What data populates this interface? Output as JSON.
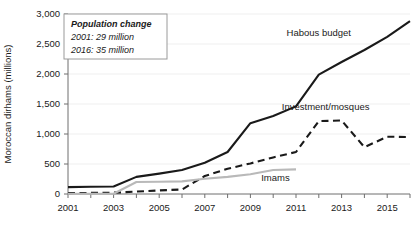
{
  "chart_data": {
    "type": "line",
    "title": "",
    "xlabel": "",
    "ylabel": "Moroccan dirhams (millions)",
    "xlim": [
      2001,
      2016
    ],
    "ylim": [
      0,
      3000
    ],
    "grid": true,
    "legend_position": "inline-labels",
    "x": [
      2001,
      2002,
      2003,
      2004,
      2005,
      2006,
      2007,
      2008,
      2009,
      2010,
      2011,
      2012,
      2013,
      2014,
      2015,
      2016
    ],
    "xticks": [
      "2001",
      "2003",
      "2005",
      "2007",
      "2009",
      "2011",
      "2013",
      "2015"
    ],
    "xtick_values": [
      2001,
      2003,
      2005,
      2007,
      2009,
      2011,
      2013,
      2015
    ],
    "yticks": [
      "0",
      "500",
      "1,000",
      "1,500",
      "2,000",
      "2,500",
      "3,000"
    ],
    "ytick_values": [
      0,
      500,
      1000,
      1500,
      2000,
      2500,
      3000
    ],
    "series": [
      {
        "name": "Habous budget",
        "style": "solid",
        "color": "#1a1a1a",
        "width": 2.1,
        "label_x": 2012.0,
        "label_y": 2640,
        "values": [
          115,
          120,
          125,
          285,
          340,
          400,
          520,
          700,
          1180,
          1300,
          1460,
          1990,
          2200,
          2400,
          2620,
          2880
        ]
      },
      {
        "name": "Investment/mosques",
        "style": "dashed",
        "color": "#1a1a1a",
        "width": 2.1,
        "label_x": 2012.3,
        "label_y": 1400,
        "values": [
          15,
          18,
          22,
          40,
          60,
          75,
          300,
          420,
          510,
          610,
          700,
          1215,
          1225,
          780,
          955,
          950
        ]
      },
      {
        "name": "Imams",
        "style": "solid",
        "color": "#b9b9b9",
        "width": 2.1,
        "label_x": 2010.1,
        "label_y": 220,
        "values": [
          5,
          5,
          5,
          200,
          205,
          210,
          255,
          285,
          330,
          400,
          410,
          null,
          null,
          null,
          null,
          null
        ]
      }
    ]
  },
  "annotation": {
    "title": "Population change",
    "lines": [
      "2001: 29 million",
      "2016: 35 million"
    ]
  }
}
